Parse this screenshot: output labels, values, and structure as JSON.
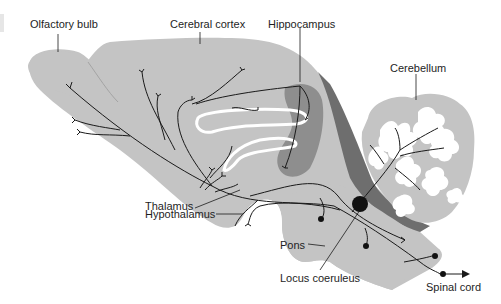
{
  "diagram": {
    "colors": {
      "brain_fill": "#c4c4c4",
      "hippocampus_fill": "#8e8e8e",
      "dark_band_fill": "#6e6e6e",
      "cerebellum_folia": "#ffffff",
      "axon_stroke": "#1a1a1a",
      "label_text": "#1e1e1e"
    },
    "labels": {
      "olfactory_bulb": "Olfactory bulb",
      "cerebral_cortex": "Cerebral cortex",
      "hippocampus": "Hippocampus",
      "cerebellum": "Cerebellum",
      "thalamus": "Thalamus",
      "hypothalamus": "Hypothalamus",
      "pons": "Pons",
      "locus_coeruleus": "Locus coeruleus",
      "spinal_cord": "Spinal cord"
    }
  }
}
